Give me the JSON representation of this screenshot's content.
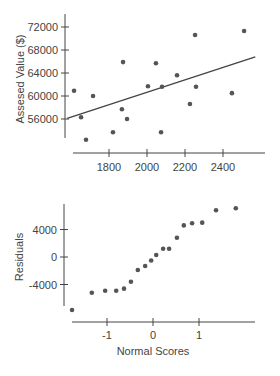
{
  "chart_data": [
    {
      "type": "scatter",
      "title": "",
      "xlabel": "",
      "ylabel": "Assesed Value ($)",
      "xlim": [
        1560,
        2620
      ],
      "ylim": [
        51000,
        74500
      ],
      "xticks": [
        1800,
        2000,
        2200,
        2400
      ],
      "xtick_labels": [
        "1800",
        "2000",
        "2200",
        "2400"
      ],
      "yticks": [
        56000,
        60000,
        64000,
        68000,
        72000
      ],
      "ytick_labels": [
        "56000",
        "60000",
        "64000",
        "68000",
        "72000"
      ],
      "grid": false,
      "points": [
        {
          "x": 1616,
          "y": 60900
        },
        {
          "x": 1653,
          "y": 56300
        },
        {
          "x": 1679,
          "y": 52400
        },
        {
          "x": 1716,
          "y": 60000
        },
        {
          "x": 1821,
          "y": 53700
        },
        {
          "x": 1868,
          "y": 57700
        },
        {
          "x": 1874,
          "y": 65900
        },
        {
          "x": 1895,
          "y": 56000
        },
        {
          "x": 2005,
          "y": 61700
        },
        {
          "x": 2047,
          "y": 65700
        },
        {
          "x": 2074,
          "y": 53700
        },
        {
          "x": 2079,
          "y": 61600
        },
        {
          "x": 2158,
          "y": 63600
        },
        {
          "x": 2226,
          "y": 58600
        },
        {
          "x": 2253,
          "y": 70600
        },
        {
          "x": 2258,
          "y": 61600
        },
        {
          "x": 2447,
          "y": 60500
        },
        {
          "x": 2511,
          "y": 71300
        }
      ],
      "regression_line": {
        "x1": 1580,
        "y1": 56100,
        "x2": 2570,
        "y2": 66800
      }
    },
    {
      "type": "scatter",
      "title": "",
      "xlabel": "Normal Scores",
      "ylabel": "Residuals",
      "xlim": [
        -1.95,
        2.2
      ],
      "ylim": [
        -8600,
        8800
      ],
      "xticks": [
        -1,
        0,
        1
      ],
      "xtick_labels": [
        "-1",
        "0",
        "1"
      ],
      "yticks": [
        -4000,
        0,
        4000
      ],
      "ytick_labels": [
        "-4000",
        "0",
        "4000"
      ],
      "grid": false,
      "points": [
        {
          "x": -1.76,
          "y": -7700
        },
        {
          "x": -1.33,
          "y": -5200
        },
        {
          "x": -1.04,
          "y": -4900
        },
        {
          "x": -0.8,
          "y": -4900
        },
        {
          "x": -0.63,
          "y": -4600
        },
        {
          "x": -0.48,
          "y": -3600
        },
        {
          "x": -0.33,
          "y": -1900
        },
        {
          "x": -0.17,
          "y": -1300
        },
        {
          "x": -0.04,
          "y": -500
        },
        {
          "x": 0.07,
          "y": 300
        },
        {
          "x": 0.22,
          "y": 1200
        },
        {
          "x": 0.35,
          "y": 1200
        },
        {
          "x": 0.52,
          "y": 2800
        },
        {
          "x": 0.67,
          "y": 4600
        },
        {
          "x": 0.85,
          "y": 4900
        },
        {
          "x": 1.07,
          "y": 5000
        },
        {
          "x": 1.37,
          "y": 6800
        },
        {
          "x": 1.8,
          "y": 7100
        }
      ]
    }
  ]
}
